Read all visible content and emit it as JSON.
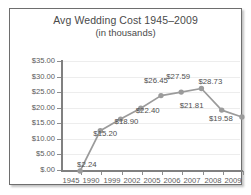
{
  "chart_data": {
    "type": "line",
    "title": "Avg Wedding Cost 1945–2009",
    "subtitle": "(in thousands)",
    "xlabel": "",
    "ylabel": "",
    "categories": [
      "1945",
      "1990",
      "1999",
      "2002",
      "2005",
      "2006",
      "2007",
      "2008",
      "2009"
    ],
    "values": [
      2.24,
      15.2,
      18.9,
      22.4,
      26.45,
      27.59,
      28.73,
      21.81,
      19.58
    ],
    "point_labels": [
      "$2.24",
      "$15.20",
      "$18.90",
      "$22.40",
      "$26.45",
      "$27.59",
      "$28.73",
      "$21.81",
      "$19.58"
    ],
    "ylim": [
      0,
      35
    ],
    "ytick_values": [
      35,
      30,
      25,
      20,
      15,
      10,
      5,
      0
    ],
    "ytick_labels": [
      "$35.00",
      "$30.00",
      "$25.00",
      "$20.00",
      "$15.00",
      "$10.00",
      "$5.00",
      "$.00"
    ],
    "grid": true,
    "legend": "none",
    "series_color": "#9b9b9b",
    "marker_color": "#9b9b9b",
    "grid_color": "#ededed",
    "axis_color": "#808080",
    "text_color": "#4f4f4f"
  }
}
